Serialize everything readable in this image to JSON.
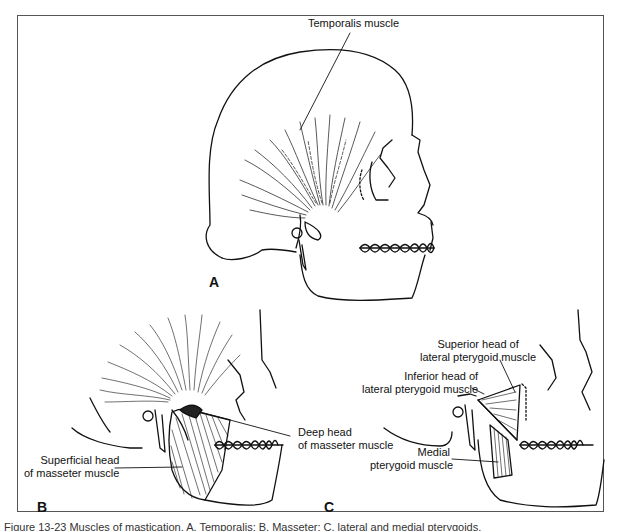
{
  "figure": {
    "caption": "Figure 13-23 Muscles of mastication. A, Temporalis; B, Masseter; C, lateral and medial pterygoids.",
    "line_color": "#111111",
    "frame_color": "#555555"
  },
  "panels": {
    "a": {
      "letter": "A",
      "labels": {
        "temporalis": "Temporalis muscle"
      }
    },
    "b": {
      "letter": "B",
      "labels": {
        "deep_head_line1": "Deep head",
        "deep_head_line2": "of masseter muscle",
        "superficial_head_line1": "Superficial head",
        "superficial_head_line2": "of masseter muscle"
      }
    },
    "c": {
      "letter": "C",
      "labels": {
        "superior_head_line1": "Superior head of",
        "superior_head_line2": "lateral pterygoid muscle",
        "inferior_head_line1": "Inferior head of",
        "inferior_head_line2": "lateral pterygoid muscle",
        "medial_line1": "Medial",
        "medial_line2": "pterygoid muscle"
      }
    }
  }
}
